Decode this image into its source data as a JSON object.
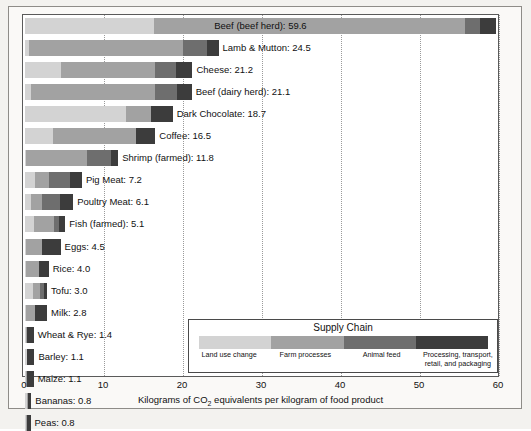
{
  "chart_data": {
    "type": "bar",
    "orientation": "horizontal",
    "stacked": true,
    "title": "",
    "xlabel": "Kilograms of CO2 equivalents per kilogram of food product",
    "ylabel": "",
    "xlim": [
      0,
      60
    ],
    "xticks": [
      0,
      10,
      20,
      30,
      40,
      50,
      60
    ],
    "xtick_labels": [
      "0",
      "10",
      "20",
      "30",
      "40",
      "50",
      "60"
    ],
    "grid": "vertical-dotted",
    "legend_position": "inside-bottom-right",
    "legend_title": "Supply Chain",
    "series": [
      {
        "name": "Land use change",
        "color": "#d3d3d3",
        "values": [
          16.3,
          0.5,
          4.5,
          0.7,
          12.8,
          3.6,
          0.1,
          1.3,
          0.8,
          1.1,
          0.1,
          0.1,
          1.0,
          0.1,
          0.1,
          0.2,
          0.1,
          0.3,
          0.1
        ]
      },
      {
        "name": "Farm processes",
        "color": "#a2a2a2",
        "values": [
          39.4,
          19.5,
          12.0,
          15.7,
          3.1,
          10.4,
          7.8,
          1.7,
          1.3,
          2.6,
          2.0,
          1.7,
          0.9,
          1.2,
          0.1,
          0.1,
          0.1,
          0.1,
          0.2
        ]
      },
      {
        "name": "Animal feed",
        "color": "#6e6e6e",
        "values": [
          1.9,
          3.0,
          2.6,
          2.8,
          0.0,
          0.0,
          3.0,
          2.7,
          2.3,
          0.6,
          0.0,
          0.0,
          0.5,
          0.0,
          0.0,
          0.0,
          0.0,
          0.0,
          0.0
        ]
      },
      {
        "name": "Processing, transport, retail, and packaging",
        "color": "#3c3c3c",
        "values": [
          2.0,
          1.5,
          2.1,
          1.9,
          2.8,
          2.5,
          0.9,
          1.5,
          1.7,
          0.8,
          2.4,
          1.2,
          0.4,
          1.5,
          0.9,
          0.9,
          0.9,
          0.4,
          0.4
        ]
      }
    ],
    "categories": [
      "Beef (beef herd)",
      "Lamb & Mutton",
      "Cheese",
      "Beef (dairy herd)",
      "Dark Chocolate",
      "Coffee",
      "Shrimp (farmed)",
      "Pig Meat",
      "Poultry Meat",
      "Fish (farmed)",
      "Eggs",
      "Rice",
      "Tofu",
      "Milk",
      "Wheat & Rye",
      "Barley",
      "Maize",
      "Bananas",
      "Peas"
    ],
    "totals": [
      59.6,
      24.5,
      21.2,
      21.1,
      18.7,
      16.5,
      11.8,
      7.2,
      6.1,
      5.1,
      4.5,
      4.0,
      3.0,
      2.8,
      1.4,
      1.1,
      1.1,
      0.8,
      0.8
    ]
  },
  "bars": [
    {
      "label": "Beef (beef herd): 59.6",
      "total": 59.6,
      "inside": true,
      "segments": [
        {
          "name": "land-use-change",
          "value": 16.3
        },
        {
          "name": "farm-processes",
          "value": 39.4
        },
        {
          "name": "animal-feed",
          "value": 1.9
        },
        {
          "name": "processing-transport-retail-packaging",
          "value": 2.0
        }
      ]
    },
    {
      "label": "Lamb & Mutton: 24.5",
      "total": 24.5,
      "inside": false,
      "segments": [
        {
          "name": "land-use-change",
          "value": 0.5
        },
        {
          "name": "farm-processes",
          "value": 19.5
        },
        {
          "name": "animal-feed",
          "value": 3.0
        },
        {
          "name": "processing-transport-retail-packaging",
          "value": 1.5
        }
      ]
    },
    {
      "label": "Cheese: 21.2",
      "total": 21.2,
      "inside": false,
      "segments": [
        {
          "name": "land-use-change",
          "value": 4.5
        },
        {
          "name": "farm-processes",
          "value": 12.0
        },
        {
          "name": "animal-feed",
          "value": 2.6
        },
        {
          "name": "processing-transport-retail-packaging",
          "value": 2.1
        }
      ]
    },
    {
      "label": "Beef (dairy herd): 21.1",
      "total": 21.1,
      "inside": false,
      "segments": [
        {
          "name": "land-use-change",
          "value": 0.7
        },
        {
          "name": "farm-processes",
          "value": 15.7
        },
        {
          "name": "animal-feed",
          "value": 2.8
        },
        {
          "name": "processing-transport-retail-packaging",
          "value": 1.9
        }
      ]
    },
    {
      "label": "Dark Chocolate: 18.7",
      "total": 18.7,
      "inside": false,
      "segments": [
        {
          "name": "land-use-change",
          "value": 12.8
        },
        {
          "name": "farm-processes",
          "value": 3.1
        },
        {
          "name": "animal-feed",
          "value": 0.0
        },
        {
          "name": "processing-transport-retail-packaging",
          "value": 2.8
        }
      ]
    },
    {
      "label": "Coffee: 16.5",
      "total": 16.5,
      "inside": false,
      "segments": [
        {
          "name": "land-use-change",
          "value": 3.6
        },
        {
          "name": "farm-processes",
          "value": 10.4
        },
        {
          "name": "animal-feed",
          "value": 0.0
        },
        {
          "name": "processing-transport-retail-packaging",
          "value": 2.5
        }
      ]
    },
    {
      "label": "Shrimp (farmed): 11.8",
      "total": 11.8,
      "inside": false,
      "segments": [
        {
          "name": "land-use-change",
          "value": 0.1
        },
        {
          "name": "farm-processes",
          "value": 7.8
        },
        {
          "name": "animal-feed",
          "value": 3.0
        },
        {
          "name": "processing-transport-retail-packaging",
          "value": 0.9
        }
      ]
    },
    {
      "label": "Pig Meat: 7.2",
      "total": 7.2,
      "inside": false,
      "segments": [
        {
          "name": "land-use-change",
          "value": 1.3
        },
        {
          "name": "farm-processes",
          "value": 1.7
        },
        {
          "name": "animal-feed",
          "value": 2.7
        },
        {
          "name": "processing-transport-retail-packaging",
          "value": 1.5
        }
      ]
    },
    {
      "label": "Poultry Meat: 6.1",
      "total": 6.1,
      "inside": false,
      "segments": [
        {
          "name": "land-use-change",
          "value": 0.8
        },
        {
          "name": "farm-processes",
          "value": 1.3
        },
        {
          "name": "animal-feed",
          "value": 2.3
        },
        {
          "name": "processing-transport-retail-packaging",
          "value": 1.7
        }
      ]
    },
    {
      "label": "Fish (farmed): 5.1",
      "total": 5.1,
      "inside": false,
      "segments": [
        {
          "name": "land-use-change",
          "value": 1.1
        },
        {
          "name": "farm-processes",
          "value": 2.6
        },
        {
          "name": "animal-feed",
          "value": 0.6
        },
        {
          "name": "processing-transport-retail-packaging",
          "value": 0.8
        }
      ]
    },
    {
      "label": "Eggs: 4.5",
      "total": 4.5,
      "inside": false,
      "segments": [
        {
          "name": "land-use-change",
          "value": 0.1
        },
        {
          "name": "farm-processes",
          "value": 2.0
        },
        {
          "name": "animal-feed",
          "value": 0.0
        },
        {
          "name": "processing-transport-retail-packaging",
          "value": 2.4
        }
      ]
    },
    {
      "label": "Rice: 4.0",
      "total": 4.0,
      "inside": false,
      "segments": [
        {
          "name": "land-use-change",
          "value": 0.1
        },
        {
          "name": "farm-processes",
          "value": 1.7
        },
        {
          "name": "animal-feed",
          "value": 0.0
        },
        {
          "name": "processing-transport-retail-packaging",
          "value": 1.2
        }
      ]
    },
    {
      "label": "Tofu: 3.0",
      "total": 3.0,
      "inside": false,
      "segments": [
        {
          "name": "land-use-change",
          "value": 1.0
        },
        {
          "name": "farm-processes",
          "value": 0.9
        },
        {
          "name": "animal-feed",
          "value": 0.5
        },
        {
          "name": "processing-transport-retail-packaging",
          "value": 0.4
        }
      ]
    },
    {
      "label": "Milk: 2.8",
      "total": 2.8,
      "inside": false,
      "segments": [
        {
          "name": "land-use-change",
          "value": 0.1
        },
        {
          "name": "farm-processes",
          "value": 1.2
        },
        {
          "name": "animal-feed",
          "value": 0.0
        },
        {
          "name": "processing-transport-retail-packaging",
          "value": 1.5
        }
      ]
    },
    {
      "label": "Wheat & Rye: 1.4",
      "total": 1.4,
      "inside": false,
      "segments": [
        {
          "name": "land-use-change",
          "value": 0.1
        },
        {
          "name": "farm-processes",
          "value": 0.1
        },
        {
          "name": "animal-feed",
          "value": 0.0
        },
        {
          "name": "processing-transport-retail-packaging",
          "value": 0.9
        }
      ]
    },
    {
      "label": "Barley: 1.1",
      "total": 1.1,
      "inside": false,
      "segments": [
        {
          "name": "land-use-change",
          "value": 0.2
        },
        {
          "name": "farm-processes",
          "value": 0.1
        },
        {
          "name": "animal-feed",
          "value": 0.0
        },
        {
          "name": "processing-transport-retail-packaging",
          "value": 0.9
        }
      ]
    },
    {
      "label": "Maize: 1.1",
      "total": 1.1,
      "inside": false,
      "segments": [
        {
          "name": "land-use-change",
          "value": 0.1
        },
        {
          "name": "farm-processes",
          "value": 0.1
        },
        {
          "name": "animal-feed",
          "value": 0.0
        },
        {
          "name": "processing-transport-retail-packaging",
          "value": 0.9
        }
      ]
    },
    {
      "label": "Bananas: 0.8",
      "total": 0.8,
      "inside": false,
      "segments": [
        {
          "name": "land-use-change",
          "value": 0.3
        },
        {
          "name": "farm-processes",
          "value": 0.1
        },
        {
          "name": "animal-feed",
          "value": 0.0
        },
        {
          "name": "processing-transport-retail-packaging",
          "value": 0.4
        }
      ]
    },
    {
      "label": "Peas: 0.8",
      "total": 0.8,
      "inside": false,
      "segments": [
        {
          "name": "land-use-change",
          "value": 0.1
        },
        {
          "name": "farm-processes",
          "value": 0.2
        },
        {
          "name": "animal-feed",
          "value": 0.0
        },
        {
          "name": "processing-transport-retail-packaging",
          "value": 0.4
        }
      ]
    }
  ],
  "legend": {
    "title": "Supply Chain",
    "items": [
      {
        "label": "Land use change",
        "color": "#d3d3d3"
      },
      {
        "label": "Farm processes",
        "color": "#a2a2a2"
      },
      {
        "label": "Animal feed",
        "color": "#6e6e6e"
      },
      {
        "label": "Processing, transport, retail, and packaging",
        "color": "#3c3c3c"
      }
    ]
  },
  "axis": {
    "ticks": [
      "0",
      "10",
      "20",
      "30",
      "40",
      "50",
      "60"
    ],
    "title_prefix": "Kilograms of CO",
    "title_sub": "2",
    "title_suffix": " equivalents per kilogram of food product"
  },
  "colors": {
    "land_use_change": "#d3d3d3",
    "farm_processes": "#a2a2a2",
    "animal_feed": "#6e6e6e",
    "processing": "#3c3c3c",
    "plot_background": "#ffffff",
    "page_background": "#f3f2ef",
    "frame": "#5a5a5a"
  }
}
